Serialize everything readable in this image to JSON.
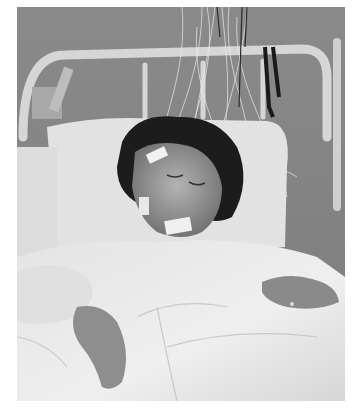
{
  "image": {
    "description": "Black-and-white photograph of a woman asleep in a hospital bed with EEG/polysomnography electrodes and wires attached to her face and head, wires running up to the metal bed headboard",
    "mode": "grayscale",
    "colors": {
      "background_wall": "#8c8c8c",
      "headboard": "#d8d8d8",
      "pillow": "#e6e6e6",
      "sheets": "#ececec",
      "hair": "#1e1e1e",
      "skin": "#9a9a9a",
      "border": "#ffffff"
    },
    "elements": [
      "metal bed headboard",
      "bundle of electrode wires",
      "pillow",
      "sleeping woman",
      "electrode tape on forehead and chin",
      "white gown",
      "bed sheets",
      "hand with ring"
    ]
  }
}
